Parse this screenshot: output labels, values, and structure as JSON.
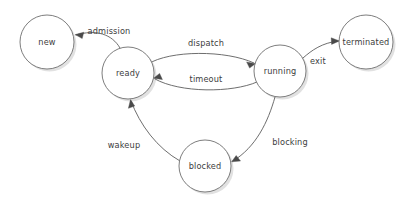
{
  "diagram": {
    "type": "state-diagram",
    "background_color": "#ffffff",
    "node_fill": "#ffffff",
    "node_stroke": "#6e6e6e",
    "edge_stroke": "#5d5d5d",
    "label_color": "#3d3d3d",
    "nodes": [
      {
        "id": "new",
        "label": "new",
        "cx": 47,
        "cy": 42,
        "r": 27
      },
      {
        "id": "ready",
        "label": "ready",
        "cx": 128,
        "cy": 73,
        "r": 26
      },
      {
        "id": "running",
        "label": "running",
        "cx": 280,
        "cy": 71,
        "r": 26
      },
      {
        "id": "terminated",
        "label": "terminated",
        "cx": 366,
        "cy": 42,
        "r": 27
      },
      {
        "id": "blocked",
        "label": "blocked",
        "cx": 205,
        "cy": 166,
        "r": 26
      }
    ],
    "edges": [
      {
        "id": "admission",
        "label": "admission",
        "from": "ready",
        "to": "new",
        "label_x": 109,
        "label_y": 31
      },
      {
        "id": "dispatch",
        "label": "dispatch",
        "from": "ready",
        "to": "running",
        "label_x": 206,
        "label_y": 43
      },
      {
        "id": "timeout",
        "label": "timeout",
        "from": "running",
        "to": "ready",
        "label_x": 206,
        "label_y": 79
      },
      {
        "id": "exit",
        "label": "exit",
        "from": "running",
        "to": "terminated",
        "label_x": 318,
        "label_y": 61
      },
      {
        "id": "blocking",
        "label": "blocking",
        "from": "running",
        "to": "blocked",
        "label_x": 290,
        "label_y": 142
      },
      {
        "id": "wakeup",
        "label": "wakeup",
        "from": "blocked",
        "to": "ready",
        "label_x": 124,
        "label_y": 145
      }
    ]
  }
}
